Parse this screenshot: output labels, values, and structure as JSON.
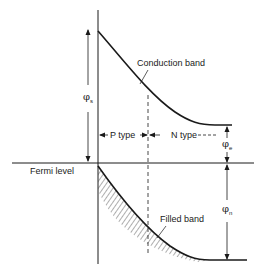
{
  "diagram": {
    "type": "energy band diagram (p-n surface junction)",
    "labels": {
      "conduction_band": "Conduction band",
      "filled_band": "Filled band",
      "fermi_level": "Fermi level",
      "p_type": "P type",
      "n_type": "N type"
    },
    "symbols": {
      "phi_s": "φ",
      "phi_s_sub": "s",
      "phi_e": "φ",
      "phi_e_sub": "e",
      "phi_n": "φ",
      "phi_n_sub": "n"
    },
    "colors": {
      "line": "#1a1a1a",
      "background": "#ffffff"
    }
  }
}
